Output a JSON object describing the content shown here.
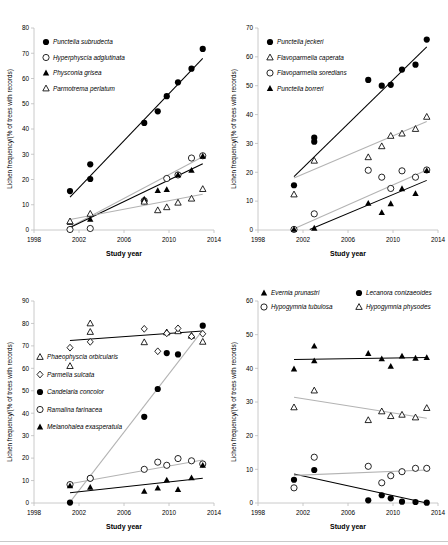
{
  "figure": {
    "axis_titles": {
      "x": "Study year",
      "y": "Lichen frequency/(% of trees with records)"
    },
    "colors": {
      "marker_fill": "#000000",
      "marker_open": "#ffffff",
      "trend_dark": "#000000",
      "trend_light": "#b3b3b3",
      "axis": "#bdbdbd"
    }
  },
  "chart_data": [
    {
      "id": "panel-top-left",
      "type": "scatter",
      "title": "",
      "xlabel": "Study year",
      "ylabel": "Lichen frequency/(% of trees with records)",
      "xlim": [
        1998,
        2014
      ],
      "ylim": [
        0,
        80
      ],
      "xticks": [
        1998,
        2002,
        2006,
        2010,
        2014
      ],
      "yticks": [
        0,
        10,
        20,
        30,
        40,
        50,
        60,
        70,
        80
      ],
      "grid": false,
      "legend_position": "top-left",
      "series": [
        {
          "name": "Punctelia subrudecta",
          "marker": "filled-circle",
          "x": [
            2001.2,
            2003.0,
            2003.0,
            2007.8,
            2009.0,
            2009.8,
            2010.8,
            2012.0,
            2013.0
          ],
          "y": [
            15.4,
            26.0,
            20.2,
            42.4,
            47.0,
            53.0,
            58.5,
            63.9,
            71.7
          ],
          "trend": {
            "style": "dark",
            "x": [
              2001.2,
              2013.0
            ],
            "y": [
              13.0,
              68.0
            ]
          }
        },
        {
          "name": "Hyperphyscia adglutinata",
          "marker": "open-circle",
          "x": [
            2001.2,
            2003.0,
            2007.8,
            2009.8,
            2010.8,
            2012.0,
            2013.0
          ],
          "y": [
            0.2,
            0.6,
            11.6,
            20.4,
            21.8,
            28.5,
            29.4
          ],
          "trend": {
            "style": "light",
            "x": [
              2001.2,
              2013.0
            ],
            "y": [
              1.2,
              29.0
            ]
          }
        },
        {
          "name": "Physconia grisea",
          "marker": "filled-triangle",
          "x": [
            2001.2,
            2003.0,
            2007.8,
            2009.0,
            2009.8,
            2010.8,
            2012.0,
            2013.0
          ],
          "y": [
            3.0,
            4.2,
            12.2,
            15.6,
            16.0,
            21.8,
            23.6,
            29.2
          ],
          "trend": {
            "style": "dark",
            "x": [
              2001.2,
              2013.0
            ],
            "y": [
              1.0,
              26.2
            ]
          }
        },
        {
          "name": "Parmotrema perlatum",
          "marker": "open-triangle",
          "x": [
            2001.2,
            2003.0,
            2007.8,
            2009.0,
            2009.8,
            2010.8,
            2012.0,
            2013.0
          ],
          "y": [
            3.4,
            6.4,
            11.2,
            7.8,
            9.0,
            10.8,
            12.4,
            16.2
          ],
          "trend": {
            "style": "light",
            "x": [
              2001.2,
              2013.0
            ],
            "y": [
              4.2,
              14.2
            ]
          }
        }
      ]
    },
    {
      "id": "panel-top-right",
      "type": "scatter",
      "title": "",
      "xlabel": "Study year",
      "ylabel": "Lichen frequency/(% of trees with records)",
      "xlim": [
        1998,
        2014
      ],
      "ylim": [
        0,
        70
      ],
      "xticks": [
        1998,
        2002,
        2006,
        2010,
        2014
      ],
      "yticks": [
        0,
        10,
        20,
        30,
        40,
        50,
        60,
        70
      ],
      "grid": false,
      "legend_position": "top-left",
      "series": [
        {
          "name": "Punctelia jeckeri",
          "marker": "filled-circle",
          "x": [
            2001.2,
            2003.0,
            2003.0,
            2007.8,
            2009.0,
            2009.8,
            2010.8,
            2012.0,
            2013.0
          ],
          "y": [
            15.5,
            32.0,
            30.6,
            52.0,
            50.0,
            50.3,
            55.6,
            57.3,
            66.0
          ],
          "trend": {
            "style": "dark",
            "x": [
              2001.2,
              2013.0
            ],
            "y": [
              18.5,
              63.5
            ]
          }
        },
        {
          "name": "Flavoparmelia caperata",
          "marker": "open-triangle",
          "x": [
            2001.2,
            2003.0,
            2007.8,
            2009.0,
            2009.8,
            2010.8,
            2012.0,
            2013.0
          ],
          "y": [
            12.3,
            24.0,
            25.2,
            29.0,
            32.6,
            33.4,
            35.0,
            39.2
          ],
          "trend": {
            "style": "light",
            "x": [
              2001.2,
              2013.0
            ],
            "y": [
              18.0,
              37.6
            ]
          }
        },
        {
          "name": "Flavoparmelia soredians",
          "marker": "open-circle",
          "x": [
            2001.2,
            2003.0,
            2007.8,
            2009.0,
            2009.8,
            2010.8,
            2012.0,
            2013.0
          ],
          "y": [
            0.2,
            5.6,
            20.7,
            18.3,
            14.4,
            20.5,
            18.3,
            20.8
          ],
          "trend": {
            "style": "light",
            "x": [
              2001.2,
              2013.0
            ],
            "y": [
              0.4,
              20.8
            ]
          }
        },
        {
          "name": "Punctelia borreri",
          "marker": "filled-triangle",
          "x": [
            2001.2,
            2003.0,
            2007.8,
            2009.0,
            2009.8,
            2010.8,
            2012.0,
            2013.0
          ],
          "y": [
            0.2,
            0.6,
            9.2,
            6.0,
            9.1,
            14.3,
            12.6,
            20.6
          ],
          "trend": {
            "style": "dark",
            "x": [
              2002.6,
              2013.0
            ],
            "y": [
              0.2,
              17.2
            ]
          }
        }
      ]
    },
    {
      "id": "panel-bottom-left",
      "type": "scatter",
      "title": "",
      "xlabel": "Study year",
      "ylabel": "Lichen frequency/(% of trees with records)",
      "xlim": [
        1998,
        2014
      ],
      "ylim": [
        0,
        90
      ],
      "xticks": [
        1998,
        2002,
        2006,
        2010,
        2014
      ],
      "yticks": [
        0,
        10,
        20,
        30,
        40,
        50,
        60,
        70,
        80,
        90
      ],
      "grid": false,
      "legend_position": "left-middle",
      "series": [
        {
          "name": "Phaeophyscia orbicularis",
          "marker": "open-triangle",
          "x": [
            2001.2,
            2003.0,
            2003.0,
            2007.8,
            2009.8,
            2010.8,
            2012.0,
            2013.0
          ],
          "y": [
            61.0,
            80.0,
            76.2,
            71.6,
            76.0,
            76.5,
            74.5,
            71.8
          ],
          "trend": {
            "style": "dark",
            "x": [
              2001.2,
              2013.0
            ],
            "y": [
              72.4,
              76.6
            ]
          }
        },
        {
          "name": "Parmelia sulcata",
          "marker": "open-diamond",
          "x": [
            2001.2,
            2003.0,
            2007.8,
            2009.0,
            2009.8,
            2010.8,
            2012.0,
            2013.0
          ],
          "y": [
            69.2,
            71.8,
            77.6,
            67.6,
            75.6,
            77.8,
            74.2,
            75.4
          ]
        },
        {
          "name": "Candelaria concolor",
          "marker": "filled-circle",
          "x": [
            2001.2,
            2003.0,
            2007.8,
            2009.0,
            2009.8,
            2010.8,
            2013.0
          ],
          "y": [
            0.2,
            11.0,
            38.4,
            50.8,
            66.8,
            66.2,
            79.0
          ],
          "trend": {
            "style": "light",
            "x": [
              2001.2,
              2013.0
            ],
            "y": [
              0.4,
              77.0
            ]
          }
        },
        {
          "name": "Ramalina farinacea",
          "marker": "open-circle",
          "x": [
            2001.2,
            2003.0,
            2007.8,
            2009.0,
            2009.8,
            2010.8,
            2012.0,
            2013.0
          ],
          "y": [
            8.2,
            11.0,
            15.0,
            18.2,
            16.8,
            19.8,
            18.8,
            17.4
          ],
          "trend": {
            "style": "light",
            "x": [
              2001.2,
              2013.0
            ],
            "y": [
              8.6,
              19.2
            ]
          }
        },
        {
          "name": "Melanohalea exasperatula",
          "marker": "filled-triangle",
          "x": [
            2001.2,
            2003.0,
            2007.8,
            2009.0,
            2009.8,
            2010.8,
            2012.0,
            2013.0
          ],
          "y": [
            7.6,
            7.0,
            5.2,
            6.6,
            10.2,
            6.0,
            11.2,
            16.8
          ],
          "trend": {
            "style": "dark",
            "x": [
              2001.2,
              2013.0
            ],
            "y": [
              4.6,
              11.0
            ]
          }
        }
      ]
    },
    {
      "id": "panel-bottom-right",
      "type": "scatter",
      "title": "",
      "xlabel": "Study year",
      "ylabel": "Lichen frequency/(% of trees with records)",
      "xlim": [
        1998,
        2014
      ],
      "ylim": [
        0,
        60
      ],
      "xticks": [
        1998,
        2002,
        2006,
        2010,
        2014
      ],
      "yticks": [
        0,
        10,
        20,
        30,
        40,
        50,
        60
      ],
      "grid": false,
      "legend_position": "top",
      "series": [
        {
          "name": "Evernia prunastri",
          "marker": "filled-triangle",
          "x": [
            2001.2,
            2003.0,
            2003.0,
            2007.8,
            2009.0,
            2009.8,
            2010.8,
            2012.0,
            2013.0
          ],
          "y": [
            39.8,
            46.6,
            42.2,
            44.4,
            42.8,
            40.6,
            43.6,
            43.0,
            43.2
          ],
          "trend": {
            "style": "dark",
            "x": [
              2001.2,
              2013.0
            ],
            "y": [
              42.6,
              43.2
            ]
          }
        },
        {
          "name": "Lecanora conizaeoides",
          "marker": "filled-circle",
          "x": [
            2001.2,
            2003.0,
            2007.8,
            2009.0,
            2009.8,
            2010.8,
            2012.0,
            2013.0
          ],
          "y": [
            6.9,
            9.8,
            0.8,
            2.3,
            1.4,
            0.4,
            0.3,
            0.1
          ],
          "trend": {
            "style": "dark",
            "x": [
              2001.2,
              2013.0
            ],
            "y": [
              8.6,
              0.0
            ]
          }
        },
        {
          "name": "Hypogymnia tubulosa",
          "marker": "open-circle",
          "x": [
            2001.2,
            2003.0,
            2007.8,
            2009.0,
            2009.8,
            2010.8,
            2012.0,
            2013.0
          ],
          "y": [
            4.5,
            13.6,
            10.9,
            6.0,
            8.1,
            9.3,
            10.3,
            10.3
          ],
          "trend": {
            "style": "light",
            "x": [
              2001.2,
              2013.0
            ],
            "y": [
              8.2,
              9.8
            ]
          }
        },
        {
          "name": "Hypogymnia physodes",
          "marker": "open-triangle",
          "x": [
            2001.2,
            2003.0,
            2007.8,
            2009.0,
            2009.8,
            2010.8,
            2012.0,
            2013.0
          ],
          "y": [
            28.4,
            33.4,
            24.6,
            27.2,
            25.8,
            26.2,
            25.4,
            28.2
          ],
          "trend": {
            "style": "light",
            "x": [
              2001.2,
              2013.0
            ],
            "y": [
              31.4,
              25.2
            ]
          }
        }
      ]
    }
  ]
}
